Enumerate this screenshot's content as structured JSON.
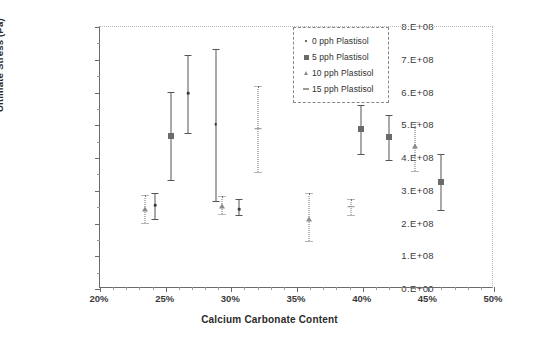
{
  "chart_data": {
    "type": "scatter",
    "title": "",
    "xlabel": "Calcium Carbonate Content",
    "ylabel": "Ultimate Stress (Pa)",
    "xlim": [
      20,
      50
    ],
    "ylim": [
      0,
      800000000
    ],
    "xticks": [
      "20%",
      "25%",
      "30%",
      "35%",
      "40%",
      "45%",
      "50%"
    ],
    "xtick_values": [
      20,
      25,
      30,
      35,
      40,
      45,
      50
    ],
    "yticks": [
      "0.E+00",
      "1.E+08",
      "2.E+08",
      "3.E+08",
      "4.E+08",
      "5.E+08",
      "6.E+08",
      "7.E+08",
      "8.E+08"
    ],
    "ytick_values": [
      0,
      100000000,
      200000000,
      300000000,
      400000000,
      500000000,
      600000000,
      700000000,
      800000000
    ],
    "grid": false,
    "legend_position": "top-right",
    "error_bars": true,
    "series": [
      {
        "name": "0 pph Plastisol",
        "marker": "dot",
        "line_style": "solid",
        "points": [
          {
            "x": 24.2,
            "y": 255000000,
            "err_low": 40000000,
            "err_high": 38000000
          },
          {
            "x": 26.7,
            "y": 597000000,
            "err_low": 122000000,
            "err_high": 118000000
          },
          {
            "x": 28.8,
            "y": 504000000,
            "err_low": 234000000,
            "err_high": 230000000
          },
          {
            "x": 30.6,
            "y": 243000000,
            "err_low": 17000000,
            "err_high": 33000000
          }
        ]
      },
      {
        "name": "5 pph Plastisol",
        "marker": "square",
        "line_style": "solid",
        "points": [
          {
            "x": 25.4,
            "y": 468000000,
            "err_low": 134000000,
            "err_high": 134000000
          },
          {
            "x": 39.9,
            "y": 490000000,
            "err_low": 78000000,
            "err_high": 72000000
          },
          {
            "x": 42.0,
            "y": 463000000,
            "err_low": 70000000,
            "err_high": 68000000
          },
          {
            "x": 46.0,
            "y": 326000000,
            "err_low": 84000000,
            "err_high": 86000000
          }
        ]
      },
      {
        "name": "10 pph Plastisol",
        "marker": "triangle",
        "line_style": "dotted",
        "points": [
          {
            "x": 23.4,
            "y": 245000000,
            "err_low": 42000000,
            "err_high": 42000000
          },
          {
            "x": 29.3,
            "y": 254000000,
            "err_low": 26000000,
            "err_high": 31000000
          },
          {
            "x": 35.9,
            "y": 215000000,
            "err_low": 68000000,
            "err_high": 79000000
          },
          {
            "x": 44.0,
            "y": 437000000,
            "err_low": 76000000,
            "err_high": 74000000
          }
        ]
      },
      {
        "name": "15 pph Plastisol",
        "marker": "dash",
        "line_style": "dotted",
        "points": [
          {
            "x": 32.0,
            "y": 489000000,
            "err_low": 131000000,
            "err_high": 131000000
          },
          {
            "x": 39.1,
            "y": 251000000,
            "err_low": 24000000,
            "err_high": 25000000
          }
        ]
      }
    ]
  },
  "legend": {
    "items": [
      {
        "label": "0 pph Plastisol",
        "key": "dot"
      },
      {
        "label": "5 pph Plastisol",
        "key": "square"
      },
      {
        "label": "10 pph Plastisol",
        "key": "triangle"
      },
      {
        "label": "15 pph Plastisol",
        "key": "dash"
      }
    ]
  },
  "colors": {
    "axis": "#6b6b6b",
    "text": "#2b2b2b",
    "marker_dot": "#3a3a3a",
    "marker_square": "#6a6a6a",
    "marker_triangle": "#8a8a8a",
    "marker_dash": "#9a9a9a",
    "background": "#ffffff"
  }
}
